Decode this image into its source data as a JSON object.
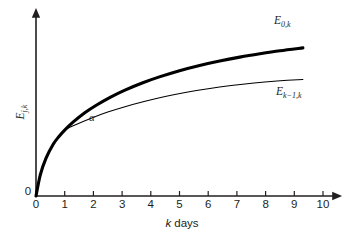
{
  "chart_data": {
    "type": "line",
    "title": "",
    "xlabel": "k days",
    "ylabel": "E j,k",
    "xlim": [
      0,
      10
    ],
    "ylim": [
      0,
      1.08
    ],
    "grid": false,
    "legend": "inline-right",
    "xticks": [
      "0",
      "1",
      "2",
      "3",
      "4",
      "5",
      "6",
      "7",
      "8",
      "9",
      "10"
    ],
    "xtick_values": [
      0,
      1,
      2,
      3,
      4,
      5,
      6,
      7,
      8,
      9,
      10
    ],
    "yticks": [
      "0"
    ],
    "annotations": [
      {
        "name": "angle-alpha",
        "text": "α",
        "x": 1.95,
        "y": 0.47
      }
    ],
    "series": [
      {
        "name": "E_0k",
        "label_main": "E",
        "label_sub": "0,k",
        "style": "thick",
        "x": [
          0,
          0.15,
          0.35,
          0.6,
          0.8,
          1.0,
          1.3,
          1.7,
          2.1,
          2.6,
          3.1,
          3.7,
          4.3,
          5.0,
          5.7,
          6.4,
          7.1,
          7.8,
          8.5,
          9.3
        ],
        "y": [
          0,
          0.133,
          0.238,
          0.325,
          0.374,
          0.414,
          0.465,
          0.523,
          0.57,
          0.621,
          0.665,
          0.71,
          0.748,
          0.787,
          0.82,
          0.848,
          0.872,
          0.893,
          0.912,
          0.93
        ]
      },
      {
        "name": "E_k-1k",
        "label_main": "E",
        "label_sub": "k−1,k",
        "style": "thin",
        "x": [
          0,
          0.15,
          0.35,
          0.6,
          0.8,
          1.0,
          1.4,
          1.9,
          2.5,
          3.1,
          3.8,
          4.5,
          5.2,
          6.0,
          6.8,
          7.6,
          8.4,
          9.3
        ],
        "y": [
          0,
          0.133,
          0.238,
          0.325,
          0.374,
          0.414,
          0.449,
          0.487,
          0.527,
          0.561,
          0.595,
          0.625,
          0.65,
          0.674,
          0.694,
          0.71,
          0.722,
          0.732
        ]
      }
    ]
  },
  "labels": {
    "origin_y": "0",
    "axis_x_title_italic": "k",
    "axis_x_title_rest": " days",
    "y_axis_main": "E",
    "y_axis_sub": "j,k"
  }
}
